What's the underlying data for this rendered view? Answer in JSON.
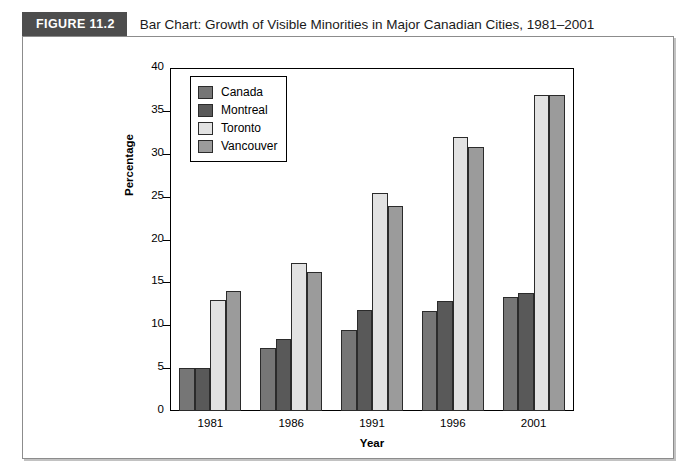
{
  "figure": {
    "number_label": "FIGURE 11.2",
    "title": "Bar Chart: Growth of Visible Minorities in Major Canadian Cities, 1981–2001"
  },
  "colors": {
    "header_block": "#4d4d4d",
    "canada": "#767676",
    "montreal": "#595959",
    "toronto": "#e2e2e2",
    "vancouver": "#9b9b9b",
    "frame": "#8c8c8c",
    "axis": "#000000"
  },
  "chart_data": {
    "type": "bar",
    "title": "Bar Chart: Growth of Visible Minorities in Major Canadian Cities, 1981–2001",
    "xlabel": "Year",
    "ylabel": "Percentage",
    "ylim": [
      0,
      40
    ],
    "yticks": [
      0,
      5,
      10,
      15,
      20,
      25,
      30,
      35,
      40
    ],
    "grid": false,
    "legend_position": "top-left inside plot",
    "categories": [
      "1981",
      "1986",
      "1991",
      "1996",
      "2001"
    ],
    "series": [
      {
        "name": "Canada",
        "color": "#767676",
        "values": [
          5.0,
          7.3,
          9.4,
          11.7,
          13.3
        ]
      },
      {
        "name": "Montreal",
        "color": "#595959",
        "values": [
          5.0,
          8.4,
          11.8,
          12.8,
          13.8
        ]
      },
      {
        "name": "Toronto",
        "color": "#e2e2e2",
        "values": [
          12.9,
          17.3,
          25.4,
          31.9,
          36.9
        ]
      },
      {
        "name": "Vancouver",
        "color": "#9b9b9b",
        "values": [
          14.0,
          16.2,
          23.9,
          30.8,
          36.9
        ]
      }
    ]
  }
}
